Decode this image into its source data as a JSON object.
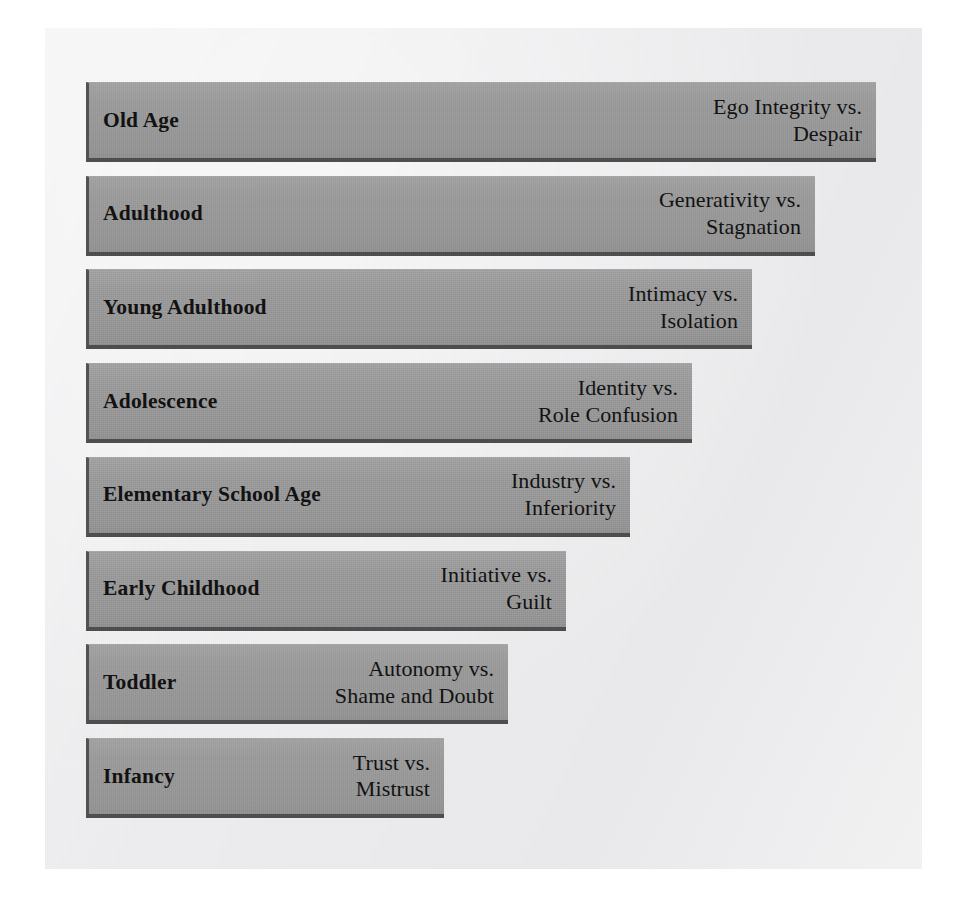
{
  "figure": {
    "orientation": "horizontal-bars-descending",
    "colors": {
      "page_background": "#ffffff",
      "paper_background": "#eeeef0",
      "bar_fill": "#9b9b9b",
      "bar_border": "#4d4d4d",
      "text": "#121212"
    }
  },
  "stages": [
    {
      "stage_label": "Old Age",
      "crisis_label": "Ego Integrity vs.\nDespair",
      "crisis_line1": "Ego Integrity vs.",
      "crisis_line2": "Despair",
      "bar_width_px": 790,
      "order": 8
    },
    {
      "stage_label": "Adulthood",
      "crisis_label": "Generativity vs.\nStagnation",
      "crisis_line1": "Generativity vs.",
      "crisis_line2": "Stagnation",
      "bar_width_px": 729,
      "order": 7
    },
    {
      "stage_label": "Young Adulthood",
      "crisis_label": "Intimacy vs.\nIsolation",
      "crisis_line1": "Intimacy vs.",
      "crisis_line2": "Isolation",
      "bar_width_px": 666,
      "order": 6
    },
    {
      "stage_label": "Adolescence",
      "crisis_label": "Identity vs.\nRole Confusion",
      "crisis_line1": "Identity vs.",
      "crisis_line2": "Role Confusion",
      "bar_width_px": 606,
      "order": 5
    },
    {
      "stage_label": "Elementary School Age",
      "crisis_label": "Industry vs.\nInferiority",
      "crisis_line1": "Industry vs.",
      "crisis_line2": "Inferiority",
      "bar_width_px": 544,
      "order": 4
    },
    {
      "stage_label": "Early Childhood",
      "crisis_label": "Initiative vs.\nGuilt",
      "crisis_line1": "Initiative vs.",
      "crisis_line2": "Guilt",
      "bar_width_px": 480,
      "order": 3
    },
    {
      "stage_label": "Toddler",
      "crisis_label": "Autonomy vs.\nShame and Doubt",
      "crisis_line1": "Autonomy vs.",
      "crisis_line2": "Shame and Doubt",
      "bar_width_px": 422,
      "order": 2
    },
    {
      "stage_label": "Infancy",
      "crisis_label": "Trust vs.\nMistrust",
      "crisis_line1": "Trust vs.",
      "crisis_line2": "Mistrust",
      "bar_width_px": 358,
      "order": 1
    }
  ]
}
